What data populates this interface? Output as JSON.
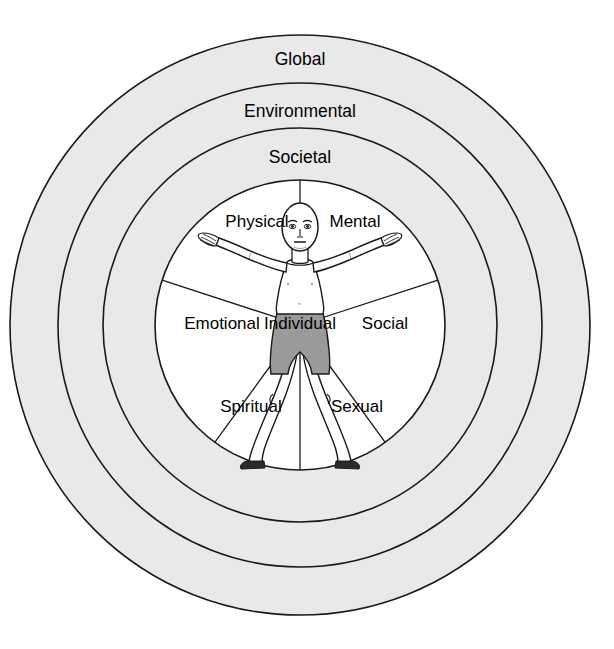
{
  "diagram": {
    "type": "concentric-circles",
    "center": {
      "x": 300,
      "y": 325
    },
    "colors": {
      "ring_fill": "#e9e9e9",
      "inner_fill": "#ffffff",
      "stroke": "#1a1a1a",
      "figure_skin": "#ffffff",
      "figure_shorts": "#9a9a9a",
      "figure_feet": "#2b2b2b",
      "page_background": "#ffffff"
    },
    "rings": [
      {
        "label": "Global",
        "level": 4,
        "outer_radius": 290,
        "inner_radius": 242,
        "fill": "#e9e9e9",
        "label_x": 300,
        "label_y": 60
      },
      {
        "label": "Environmental",
        "level": 3,
        "outer_radius": 242,
        "inner_radius": 197,
        "fill": "#e9e9e9",
        "label_x": 300,
        "label_y": 112
      },
      {
        "label": "Societal",
        "level": 2,
        "outer_radius": 197,
        "inner_radius": 145,
        "fill": "#e9e9e9",
        "label_x": 300,
        "label_y": 158
      }
    ],
    "inner_circle": {
      "label": "Individual",
      "level": 1,
      "radius": 145,
      "fill": "#ffffff",
      "label_x": 300,
      "label_y": 325,
      "sector_count": 6
    },
    "sectors": [
      {
        "label": "Physical",
        "label_x": 257,
        "label_y": 223,
        "angle_deg": 234
      },
      {
        "label": "Mental",
        "label_x": 355,
        "label_y": 223,
        "angle_deg": 306
      },
      {
        "label": "Emotional",
        "label_x": 222,
        "label_y": 325,
        "angle_deg": 180
      },
      {
        "label": "Social",
        "label_x": 385,
        "label_y": 325,
        "angle_deg": 0
      },
      {
        "label": "Spiritual",
        "label_x": 251,
        "label_y": 408,
        "angle_deg": 126
      },
      {
        "label": "Sexual",
        "label_x": 357,
        "label_y": 408,
        "angle_deg": 54
      }
    ],
    "spokes_deg": [
      270,
      342,
      54,
      90,
      126,
      198
    ],
    "figure": {
      "name": "vitruvian-human-figure",
      "description": "Front-facing human figure with arms outstretched upward and legs spread, wearing gray shorts, dark feet"
    }
  }
}
